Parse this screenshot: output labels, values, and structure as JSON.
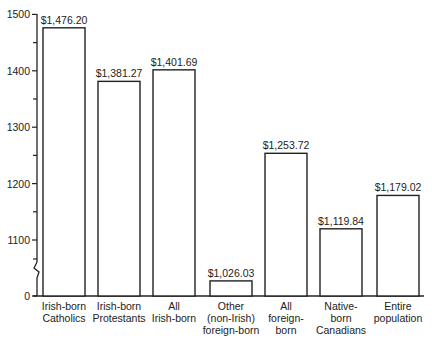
{
  "chart_data": {
    "type": "bar",
    "title": "",
    "xlabel": "",
    "ylabel": "",
    "ylim": [
      0,
      1500
    ],
    "axis_break": "between 0 and 1100",
    "grid": false,
    "legend": null,
    "yticks": [
      {
        "value": 1500,
        "label": "1500"
      },
      {
        "value": 1400,
        "label": "1400"
      },
      {
        "value": 1300,
        "label": "1300"
      },
      {
        "value": 1200,
        "label": "1200"
      },
      {
        "value": 1100,
        "label": "1100"
      },
      {
        "value": 0,
        "label": "0"
      }
    ],
    "categories": [
      "Irish-born Catholics",
      "Irish-born Protestants",
      "All Irish-born",
      "Other (non-Irish) foreign-born",
      "All foreign-born",
      "Native-born Canadians",
      "Entire population"
    ],
    "category_lines": [
      [
        "Irish-born",
        "Catholics"
      ],
      [
        "Irish-born",
        "Protestants"
      ],
      [
        "All",
        "Irish-born"
      ],
      [
        "Other",
        "(non-Irish)",
        "foreign-born"
      ],
      [
        "All",
        "foreign-",
        "born"
      ],
      [
        "Native-",
        "born",
        "Canadians"
      ],
      [
        "Entire",
        "population"
      ]
    ],
    "values": [
      1476.2,
      1381.27,
      1401.69,
      1026.03,
      1253.72,
      1119.84,
      1179.02
    ],
    "value_labels": [
      "$1,476.20",
      "$1,381.27",
      "$1,401.69",
      "$1,026.03",
      "$1,253.72",
      "$1,119.84",
      "$1,179.02"
    ]
  }
}
